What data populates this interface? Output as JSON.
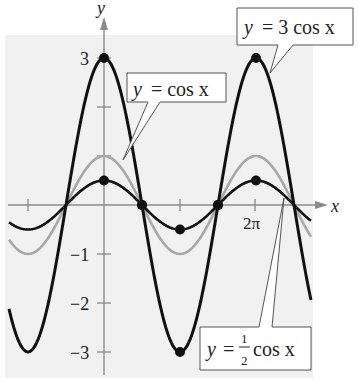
{
  "chart_data": {
    "type": "line",
    "title": "",
    "xlabel": "x",
    "ylabel": "y",
    "xlim_pi": [
      -1.25,
      2.75
    ],
    "ylim": [
      -3.3,
      3.4
    ],
    "x_ticks": [
      {
        "value_pi": -1,
        "label": ""
      },
      {
        "value_pi": 1,
        "label": ""
      },
      {
        "value_pi": 2,
        "label": "2π"
      }
    ],
    "y_ticks": [
      {
        "value": 3,
        "label": "3"
      },
      {
        "value": 2,
        "label": ""
      },
      {
        "value": 1,
        "label": ""
      },
      {
        "value": -1,
        "label": "−1"
      },
      {
        "value": -2,
        "label": "−2"
      },
      {
        "value": -3,
        "label": "−3"
      }
    ],
    "grid": false,
    "series": [
      {
        "name": "y = 3 cos x",
        "amplitude": 3,
        "color": "#111111",
        "width": 3,
        "key_points": [
          [
            0,
            3
          ],
          [
            0.5,
            0
          ],
          [
            1,
            -3
          ],
          [
            1.5,
            0
          ],
          [
            2,
            3
          ]
        ]
      },
      {
        "name": "y = cos x",
        "amplitude": 1,
        "color": "#a8a8a8",
        "width": 2.6,
        "key_points": []
      },
      {
        "name": "y = 1/2 cos x",
        "amplitude": 0.5,
        "color": "#111111",
        "width": 2.6,
        "key_points": [
          [
            0,
            0.5
          ],
          [
            0.5,
            0
          ],
          [
            1,
            -0.5
          ],
          [
            1.5,
            0
          ],
          [
            2,
            0.5
          ]
        ]
      }
    ],
    "annotations": [
      {
        "series": "y = 3 cos x",
        "text_pre": "y",
        "text_post": "= 3 cos x"
      },
      {
        "series": "y = cos x",
        "text_pre": "y",
        "text_post": "=  cos x"
      },
      {
        "series": "y = 1/2 cos x",
        "text_pre": "y",
        "text_post": "cos x",
        "fraction_num": "1",
        "fraction_den": "2"
      }
    ]
  },
  "labels": {
    "y_axis": "y",
    "x_axis": "x",
    "tick_3": "3",
    "tick_m1": "−1",
    "tick_m2": "−2",
    "tick_m3": "−3",
    "tick_2pi": "2π",
    "box_3cos_y": "y",
    "box_3cos_rest": "= 3 cos x",
    "box_cos_y": "y",
    "box_cos_rest": "=  cos x",
    "box_half_y": "y",
    "box_half_eq": "=",
    "box_half_num": "1",
    "box_half_den": "2",
    "box_half_rest": "cos x"
  }
}
